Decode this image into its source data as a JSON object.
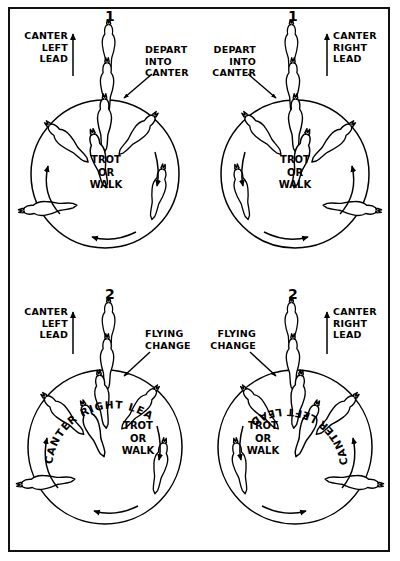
{
  "figure": {
    "background_color": "#ffffff",
    "ink_color": "#000000",
    "frame": "thin black rectangular border"
  },
  "panels": [
    {
      "id": "top-left",
      "number": "1",
      "lead_label": "CANTER\nLEFT\nLEAD",
      "lead_align": "right",
      "action_label": "DEPART\nINTO\nCANTER",
      "action_align": "left",
      "circle_label": "TROT\nOR\nWALK",
      "arc_label": null,
      "direction": "counterclockwise"
    },
    {
      "id": "top-right",
      "number": "1",
      "lead_label": "CANTER\nRIGHT\nLEAD",
      "lead_align": "left",
      "action_label": "DEPART\nINTO\nCANTER",
      "action_align": "right",
      "circle_label": "TROT\nOR\nWALK",
      "arc_label": null,
      "direction": "clockwise"
    },
    {
      "id": "bottom-left",
      "number": "2",
      "lead_label": "CANTER\nLEFT\nLEAD",
      "lead_align": "right",
      "action_label": "FLYING\nCHANGE",
      "action_align": "left",
      "circle_label": "TROT\nOR\nWALK",
      "arc_label": "CANTER RIGHT LEAD",
      "direction": "counterclockwise"
    },
    {
      "id": "bottom-right",
      "number": "2",
      "lead_label": "CANTER\nRIGHT\nLEAD",
      "lead_align": "left",
      "action_label": "FLYING\nCHANGE",
      "action_align": "right",
      "circle_label": "TROT\nOR\nWALK",
      "arc_label": "CANTER LEFT LEAD",
      "direction": "clockwise"
    }
  ]
}
